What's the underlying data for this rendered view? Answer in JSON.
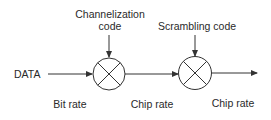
{
  "diagram": {
    "input_label": "DATA",
    "channelization": {
      "line1": "Channelization",
      "line2": "code"
    },
    "scrambling": {
      "label": "Scrambling code"
    },
    "rates": {
      "input": "Bit rate",
      "middle": "Chip rate",
      "output": "Chip rate"
    },
    "nodes": [
      {
        "id": "multiplier-1",
        "type": "multiplier",
        "symbol": "circle-x"
      },
      {
        "id": "multiplier-2",
        "type": "multiplier",
        "symbol": "circle-x"
      }
    ],
    "colors": {
      "stroke": "#333333",
      "text": "#2a2a2a",
      "background": "#ffffff"
    }
  }
}
